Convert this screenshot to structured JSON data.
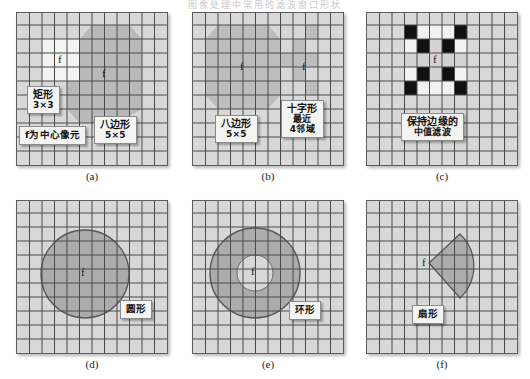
{
  "figure": {
    "top_cut_text": "图像处理中常用的滤波窗口形状",
    "background": "#ffffff",
    "grid_fill": "#d8d8d8",
    "grid_line": "#4a4a4a",
    "shape_fill": "#a9a9a9",
    "white_fill": "#f4f4f2",
    "black_fill": "#101010"
  },
  "panels": [
    {
      "id": "a",
      "caption": "(a)",
      "grid": {
        "cols": 12,
        "rows": 11
      },
      "f_markers": [
        {
          "label": "f",
          "col": 2,
          "row": 2
        },
        {
          "label": "f",
          "col": 8,
          "row": 3
        }
      ],
      "callouts": [
        {
          "name": "rect-label",
          "lines": [
            "矩形",
            "3×3"
          ]
        },
        {
          "name": "center-label",
          "lines": [
            "f为中心像元"
          ]
        },
        {
          "name": "octagon-label",
          "lines": [
            "八边形",
            "5×5"
          ]
        }
      ]
    },
    {
      "id": "b",
      "caption": "(b)",
      "grid": {
        "cols": 12,
        "rows": 11
      },
      "f_markers": [
        {
          "label": "f",
          "col": 4,
          "row": 4
        },
        {
          "label": "f",
          "col": 9,
          "row": 4
        }
      ],
      "callouts": [
        {
          "name": "octagon-label",
          "lines": [
            "八边形",
            "5×5"
          ]
        },
        {
          "name": "cross-label",
          "lines": [
            "十字形",
            "最近",
            "4邻域"
          ]
        }
      ]
    },
    {
      "id": "c",
      "caption": "(c)",
      "grid": {
        "cols": 12,
        "rows": 11
      },
      "f_markers": [
        {
          "label": "f",
          "col": 5,
          "row": 3,
          "light": true
        }
      ],
      "callouts": [
        {
          "name": "median-filter-label",
          "lines": [
            "保持边缘的",
            "中值滤波"
          ]
        }
      ]
    },
    {
      "id": "d",
      "caption": "(d)",
      "grid": {
        "cols": 12,
        "rows": 11
      },
      "f_markers": [
        {
          "label": "f",
          "col": 5,
          "row": 4
        }
      ],
      "callouts": [
        {
          "name": "circle-label",
          "lines": [
            "圆形"
          ]
        }
      ]
    },
    {
      "id": "e",
      "caption": "(e)",
      "grid": {
        "cols": 12,
        "rows": 11
      },
      "f_markers": [
        {
          "label": "f",
          "col": 4,
          "row": 4
        }
      ],
      "callouts": [
        {
          "name": "annulus-label",
          "lines": [
            "环形"
          ]
        }
      ]
    },
    {
      "id": "f",
      "caption": "(f)",
      "grid": {
        "cols": 12,
        "rows": 11
      },
      "f_markers": [
        {
          "label": "f",
          "col": 4,
          "row": 4
        }
      ],
      "callouts": [
        {
          "name": "sector-label",
          "lines": [
            "扇形"
          ]
        }
      ]
    }
  ]
}
